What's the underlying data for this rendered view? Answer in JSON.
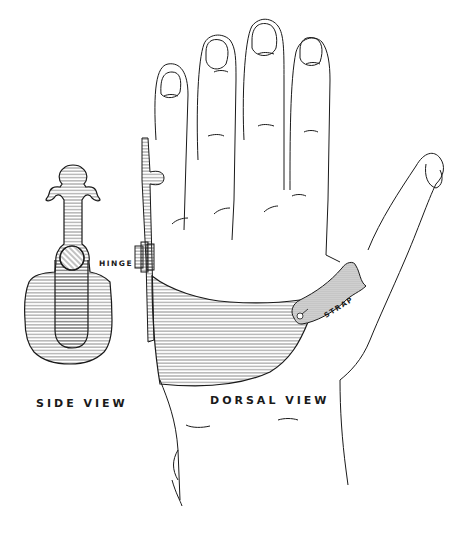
{
  "figure": {
    "labels": {
      "side_view": "SIDE VIEW",
      "dorsal_view": "DORSAL VIEW",
      "hinge": "HINGE",
      "strap": "STRAP"
    },
    "colors": {
      "line": "#1a1a1a",
      "background": "#ffffff"
    }
  }
}
